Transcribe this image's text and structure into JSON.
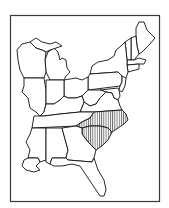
{
  "map": {
    "region": "Eastern United States",
    "style": "black-and-white outline",
    "highlighted_states": [
      "North Carolina",
      "South Carolina"
    ],
    "highlight_pattern": "vertical-hatch",
    "colors": {
      "outline": "#111111",
      "frame": "#3a3a3a",
      "background": "#ffffff",
      "hatch": "#222222"
    }
  }
}
